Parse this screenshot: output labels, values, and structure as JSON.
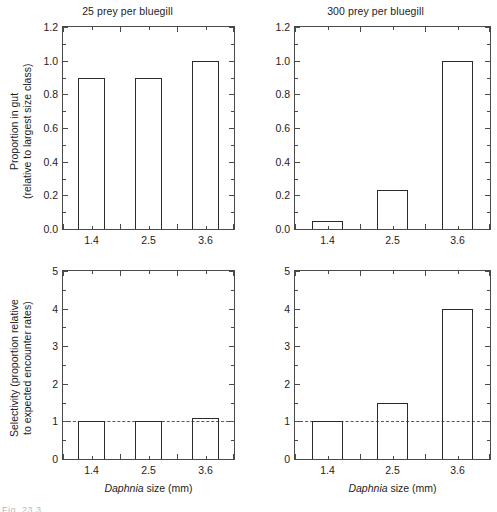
{
  "figure": {
    "caption_fragment": "Fig. 23.3"
  },
  "axis_titles": {
    "y_top": "Proportion in gut\n(relative to largest size class)",
    "y_bottom": "Selectivity (proportion relative\nto expected encounter rates)",
    "x": "Daphnia size (mm)",
    "x_italic_word": "Daphnia",
    "x_rest": " size (mm)"
  },
  "chart_data": [
    {
      "id": "top-left",
      "type": "bar",
      "title": "25 prey per bluegill",
      "categories": [
        "1.4",
        "2.5",
        "3.6"
      ],
      "values": [
        0.9,
        0.9,
        1.0
      ],
      "xlabel": "Daphnia size (mm)",
      "ylabel": "Proportion in gut (relative to largest size class)",
      "ylim": [
        0.0,
        1.2
      ],
      "yticks": [
        0.0,
        0.2,
        0.4,
        0.6,
        0.8,
        1.0,
        1.2
      ],
      "ytick_labels": [
        "0.0",
        "0.2",
        "0.4",
        "0.6",
        "0.8",
        "1.0",
        "1.2"
      ],
      "grid": false,
      "legend": "none",
      "bar_edge_color": "#2b2b2b",
      "bar_fill": "none",
      "reference_line": null
    },
    {
      "id": "top-right",
      "type": "bar",
      "title": "300 prey per bluegill",
      "categories": [
        "1.4",
        "2.5",
        "3.6"
      ],
      "values": [
        0.05,
        0.23,
        1.0
      ],
      "xlabel": "Daphnia size (mm)",
      "ylabel": "Proportion in gut (relative to largest size class)",
      "ylim": [
        0.0,
        1.2
      ],
      "yticks": [
        0.0,
        0.2,
        0.4,
        0.6,
        0.8,
        1.0,
        1.2
      ],
      "ytick_labels": [
        "0.0",
        "0.2",
        "0.4",
        "0.6",
        "0.8",
        "1.0",
        "1.2"
      ],
      "grid": false,
      "legend": "none",
      "bar_edge_color": "#2b2b2b",
      "bar_fill": "none",
      "reference_line": null
    },
    {
      "id": "bottom-left",
      "type": "bar",
      "title": "",
      "categories": [
        "1.4",
        "2.5",
        "3.6"
      ],
      "values": [
        1.0,
        1.0,
        1.08
      ],
      "xlabel": "Daphnia size (mm)",
      "ylabel": "Selectivity (proportion relative to expected encounter rates)",
      "ylim": [
        0,
        5
      ],
      "yticks": [
        0,
        1,
        2,
        3,
        4,
        5
      ],
      "ytick_labels": [
        "0",
        "1",
        "2",
        "3",
        "4",
        "5"
      ],
      "grid": false,
      "legend": "none",
      "bar_edge_color": "#2b2b2b",
      "bar_fill": "none",
      "reference_line": {
        "value": 1,
        "style": "dashed",
        "color": "#4a4fa8"
      }
    },
    {
      "id": "bottom-right",
      "type": "bar",
      "title": "",
      "categories": [
        "1.4",
        "2.5",
        "3.6"
      ],
      "values": [
        1.0,
        1.48,
        4.0
      ],
      "xlabel": "Daphnia size (mm)",
      "ylabel": "Selectivity (proportion relative to expected encounter rates)",
      "ylim": [
        0,
        5
      ],
      "yticks": [
        0,
        1,
        2,
        3,
        4,
        5
      ],
      "ytick_labels": [
        "0",
        "1",
        "2",
        "3",
        "4",
        "5"
      ],
      "grid": false,
      "legend": "none",
      "bar_edge_color": "#2b2b2b",
      "bar_fill": "none",
      "reference_line": {
        "value": 1,
        "style": "dashed",
        "color": "#4a4fa8"
      }
    }
  ]
}
